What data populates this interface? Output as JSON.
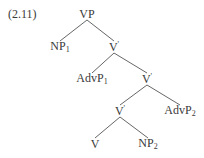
{
  "example_number": "(2.11)",
  "tree": {
    "nodes": [
      {
        "id": "vp",
        "label": "VP",
        "sub": "",
        "sup": "",
        "x": 87,
        "y": 14
      },
      {
        "id": "np1",
        "label": "NP",
        "sub": "1",
        "sup": "",
        "x": 60,
        "y": 47
      },
      {
        "id": "vbar1",
        "label": "V",
        "sub": "",
        "sup": "'",
        "x": 114,
        "y": 47
      },
      {
        "id": "advp1",
        "label": "AdvP",
        "sub": "1",
        "sup": "",
        "x": 92,
        "y": 79
      },
      {
        "id": "vbar2",
        "label": "V",
        "sub": "",
        "sup": "'",
        "x": 147,
        "y": 79
      },
      {
        "id": "vbar3",
        "label": "V",
        "sub": "",
        "sup": "'",
        "x": 120,
        "y": 111
      },
      {
        "id": "advp2",
        "label": "AdvP",
        "sub": "2",
        "sup": "",
        "x": 180,
        "y": 111
      },
      {
        "id": "v",
        "label": "V",
        "sub": "",
        "sup": "",
        "x": 95,
        "y": 144
      },
      {
        "id": "np2",
        "label": "NP",
        "sub": "2",
        "sup": "",
        "x": 148,
        "y": 144
      }
    ],
    "edges": [
      {
        "from": "vp",
        "to": "np1"
      },
      {
        "from": "vp",
        "to": "vbar1"
      },
      {
        "from": "vbar1",
        "to": "advp1"
      },
      {
        "from": "vbar1",
        "to": "vbar2"
      },
      {
        "from": "vbar2",
        "to": "vbar3"
      },
      {
        "from": "vbar2",
        "to": "advp2"
      },
      {
        "from": "vbar3",
        "to": "v"
      },
      {
        "from": "vbar3",
        "to": "np2"
      }
    ]
  }
}
